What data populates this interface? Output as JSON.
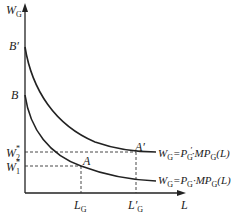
{
  "diagram": {
    "y_axis_label": "W",
    "y_axis_sub": "G",
    "x_axis_label": "L",
    "b_prime": "B′",
    "b": "B",
    "w2": "W",
    "w2_sub": "2",
    "w2_sup": "*",
    "w1": "W",
    "w1_sub": "1",
    "w1_sup": "*",
    "point_a": "A",
    "point_a_prime": "A′",
    "lg": "L",
    "lg_sub": "G",
    "lg_prime": "L′",
    "lg_prime_sub": "G",
    "upper_curve_label": "W_G = P′_G · MP_G(L)",
    "lower_curve_label": "W_G = P_G · MP_G(L)",
    "eq_w": "W",
    "eq_g": "G",
    "eq_eq": "=P",
    "eq_prime": "′",
    "eq_dot": "·MP",
    "eq_l": "(L)"
  }
}
